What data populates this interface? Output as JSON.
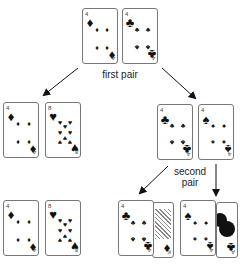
{
  "labels": {
    "first_pair": "first pair",
    "second_pair_line1": "second",
    "second_pair_line2": "pair"
  },
  "cards": {
    "top_left": {
      "rank": "4",
      "suit": "diamonds",
      "glyph": "♦"
    },
    "top_right": {
      "rank": "4",
      "suit": "clubs",
      "glyph": "♣"
    },
    "mid_left_a": {
      "rank": "4",
      "suit": "diamonds",
      "glyph": "♦"
    },
    "mid_left_b": {
      "rank": "8",
      "suit": "hearts",
      "glyph": "♥"
    },
    "mid_right_a": {
      "rank": "4",
      "suit": "clubs",
      "glyph": "♣"
    },
    "mid_right_b": {
      "rank": "4",
      "suit": "spades",
      "glyph": "♠"
    },
    "bot_left_a": {
      "rank": "4",
      "suit": "diamonds",
      "glyph": "♦"
    },
    "bot_left_b": {
      "rank": "8",
      "suit": "hearts",
      "glyph": "♥"
    },
    "bot_right_a": {
      "rank": "4",
      "suit": "clubs",
      "glyph": "♣"
    },
    "bot_right_a_under": {
      "rank": "K",
      "suit": "diamonds",
      "glyph": "♦"
    },
    "bot_right_b": {
      "rank": "4",
      "suit": "spades",
      "glyph": "♠"
    },
    "bot_right_b_under": {
      "rank": "A",
      "suit": "clubs",
      "glyph": "♣"
    }
  },
  "colors": {
    "ink": "#111111",
    "border": "#777777",
    "background": "#ffffff"
  }
}
